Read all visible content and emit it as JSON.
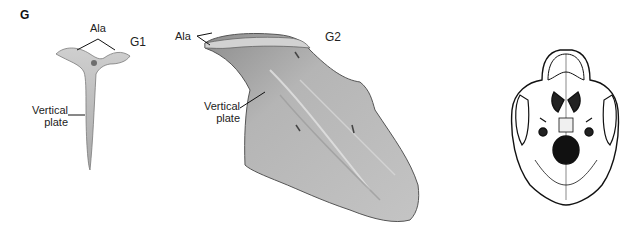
{
  "panel_letter": "G",
  "g1": {
    "title": "G1",
    "labels": {
      "ala": "Ala",
      "vertical_plate_line1": "Vertical",
      "vertical_plate_line2": "plate"
    }
  },
  "g2": {
    "title": "G2",
    "labels": {
      "ala": "Ala",
      "vertical_plate_line1": "Vertical",
      "vertical_plate_line2": "plate"
    }
  },
  "skull": {
    "description": "inferior view of skull"
  },
  "colors": {
    "bone_fill": "#b8b8b8",
    "bone_dark": "#8a8a8a",
    "outline": "#555555",
    "leader": "#111111"
  }
}
